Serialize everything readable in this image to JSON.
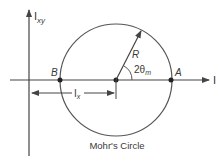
{
  "figure": {
    "caption": "Mohr's Circle",
    "colors": {
      "line": "#444444",
      "text": "#3a3a3a",
      "background": "#ffffff"
    }
  },
  "axes": {
    "horizontal_label": "I",
    "vertical_label_main": "I",
    "vertical_label_sub": "xy"
  },
  "points": {
    "A": "A",
    "B": "B"
  },
  "labels": {
    "radius": "R",
    "angle_main": "2θ",
    "angle_sub": "m",
    "dimension_main": "I",
    "dimension_sub": "x"
  }
}
